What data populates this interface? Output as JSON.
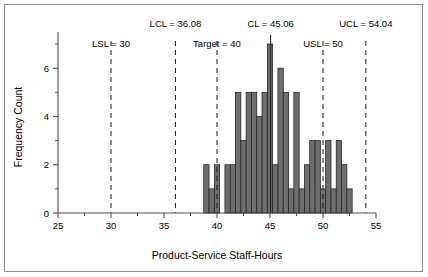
{
  "figure": {
    "frame_color": "#8c8c8c",
    "background": "#ffffff"
  },
  "axis": {
    "x_title": "Product-Service Staff-Hours",
    "y_title": "Frequency Count",
    "x_ticks": [
      "25",
      "30",
      "35",
      "40",
      "45",
      "50",
      "55"
    ],
    "y_ticks": [
      "0",
      "2",
      "4",
      "6"
    ]
  },
  "annotations": [
    {
      "name": "lsl",
      "label": "LSL = 30",
      "value": 30,
      "style": "dashed",
      "row": 1
    },
    {
      "name": "lcl",
      "label": "LCL = 36.08",
      "value": 36.08,
      "style": "dashed",
      "row": 0
    },
    {
      "name": "target",
      "label": "Target = 40",
      "value": 40,
      "style": "dashed",
      "row": 1
    },
    {
      "name": "cl",
      "label": "CL = 45.06",
      "value": 45.06,
      "style": "solid",
      "row": 0
    },
    {
      "name": "usl",
      "label": "USL = 50",
      "value": 50,
      "style": "dashed",
      "row": 1
    },
    {
      "name": "ucl",
      "label": "UCL = 54.04",
      "value": 54.04,
      "style": "dashed",
      "row": 0
    }
  ],
  "chart_data": {
    "type": "bar",
    "subtype": "histogram",
    "title": "",
    "xlabel": "Product-Service Staff-Hours",
    "ylabel": "Frequency Count",
    "xlim": [
      25,
      55
    ],
    "ylim": [
      0,
      7.5
    ],
    "xticks": [
      25,
      30,
      35,
      40,
      45,
      50,
      55
    ],
    "yticks": [
      0,
      2,
      4,
      6
    ],
    "xminorticks": [
      27.5,
      32.5,
      37.5,
      42.5,
      47.5,
      52.5
    ],
    "yminorticks": [
      1,
      3,
      5,
      7
    ],
    "grid": false,
    "legend": false,
    "bin_width": 0.5,
    "bar_color": "#6e6e6e",
    "bar_edge_color": "#262626",
    "bin_starts": [
      38.75,
      39.25,
      39.75,
      40.25,
      40.75,
      41.25,
      41.75,
      42.25,
      42.75,
      43.25,
      43.75,
      44.25,
      44.75,
      45.25,
      45.75,
      46.25,
      46.75,
      47.25,
      47.75,
      48.25,
      48.75,
      49.25,
      49.75,
      50.25,
      50.75,
      51.25,
      51.75,
      52.25
    ],
    "bin_centers": [
      39.0,
      39.5,
      40.0,
      40.5,
      41.0,
      41.5,
      42.0,
      42.5,
      43.0,
      43.5,
      44.0,
      44.5,
      45.0,
      45.5,
      46.0,
      46.5,
      47.0,
      47.5,
      48.0,
      48.5,
      49.0,
      49.5,
      50.0,
      50.5,
      51.0,
      51.5,
      52.0,
      52.5
    ],
    "values": [
      2,
      1,
      2,
      0,
      2,
      2,
      5,
      3,
      5,
      5,
      4,
      5,
      7,
      2,
      6,
      5,
      1,
      5,
      1,
      2,
      3,
      3,
      1,
      3,
      1,
      3,
      2,
      1
    ],
    "reference_lines": [
      {
        "label": "LSL = 30",
        "value": 30,
        "style": "dashed"
      },
      {
        "label": "LCL = 36.08",
        "value": 36.08,
        "style": "dashed"
      },
      {
        "label": "Target = 40",
        "value": 40,
        "style": "dashed"
      },
      {
        "label": "CL = 45.06",
        "value": 45.06,
        "style": "solid"
      },
      {
        "label": "USL = 50",
        "value": 50,
        "style": "dashed"
      },
      {
        "label": "UCL = 54.04",
        "value": 54.04,
        "style": "dashed"
      }
    ]
  }
}
